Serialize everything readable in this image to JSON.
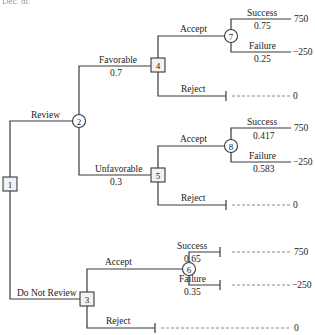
{
  "header": {
    "text": "Dec. di."
  },
  "nodes": {
    "n1": {
      "label": "1",
      "type": "decision"
    },
    "n2": {
      "label": "2",
      "type": "chance"
    },
    "n3": {
      "label": "3",
      "type": "decision"
    },
    "n4": {
      "label": "4",
      "type": "decision"
    },
    "n5": {
      "label": "5",
      "type": "decision"
    },
    "n6": {
      "label": "6",
      "type": "chance"
    },
    "n7": {
      "label": "7",
      "type": "chance"
    },
    "n8": {
      "label": "8",
      "type": "chance"
    }
  },
  "branches": {
    "review": {
      "label": "Review"
    },
    "do_not_review": {
      "label": "Do Not Review"
    },
    "favorable": {
      "label": "Favorable",
      "prob": "0.7"
    },
    "unfavorable": {
      "label": "Unfavorable",
      "prob": "0.3"
    },
    "n4_accept": {
      "label": "Accept"
    },
    "n4_reject": {
      "label": "Reject"
    },
    "n5_accept": {
      "label": "Accept"
    },
    "n5_reject": {
      "label": "Reject"
    },
    "n3_accept": {
      "label": "Accept"
    },
    "n3_reject": {
      "label": "Reject"
    },
    "n7_success": {
      "label": "Success",
      "prob": "0.75"
    },
    "n7_failure": {
      "label": "Failure",
      "prob": "0.25"
    },
    "n8_success": {
      "label": "Success",
      "prob": "0.417"
    },
    "n8_failure": {
      "label": "Failure",
      "prob": "0.583"
    },
    "n6_success": {
      "label": "Success",
      "prob": "0.65"
    },
    "n6_failure": {
      "label": "Failure",
      "prob": "0.35"
    }
  },
  "payoffs": {
    "n7_success": "750",
    "n7_failure": "−250",
    "n4_reject": "0",
    "n8_success": "750",
    "n8_failure": "−250",
    "n5_reject": "0",
    "n6_success": "750",
    "n6_failure": "−250",
    "n3_reject": "0"
  }
}
